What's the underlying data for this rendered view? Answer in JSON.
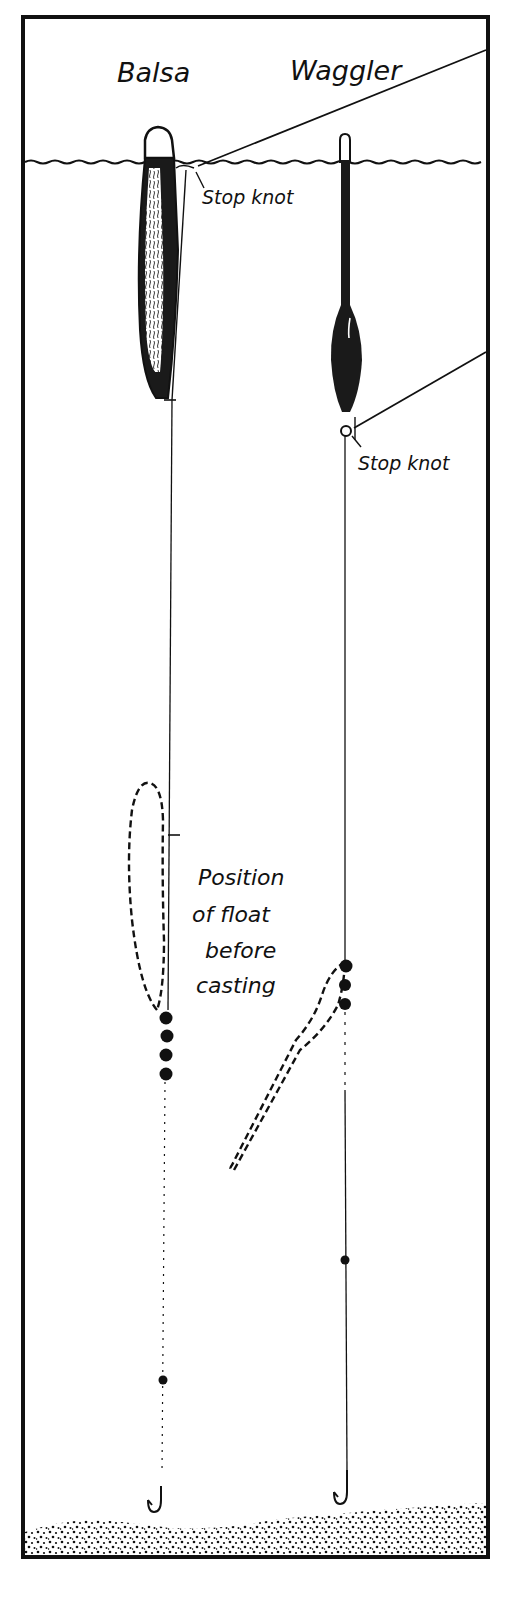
{
  "diagram": {
    "colors": {
      "ink": "#111111",
      "paper": "#ffffff",
      "float_body": "#1a1a1a",
      "float_tip": "#ffffff"
    },
    "labels": {
      "balsa": "Balsa",
      "waggler": "Waggler",
      "stop_knot_balsa": "Stop knot",
      "stop_knot_waggler": "Stop knot",
      "position_line1": "Position",
      "position_line2": "of float",
      "position_line3": "before",
      "position_line4": "casting"
    },
    "elements": {
      "frame": "rectangular border",
      "water_surface": "wavy horizontal line",
      "riverbed": "stippled gravel bed",
      "balsa_float": {
        "shape": "long cigar-shaped float with white tip",
        "shot_group_count": 4,
        "lower_shot_count": 1
      },
      "waggler_float": {
        "shape": "thin stem with bulbous body, white tip",
        "shot_group_count": 3,
        "lower_shot_count": 1
      },
      "hooks": 2,
      "dashed_outlines": 2
    }
  }
}
